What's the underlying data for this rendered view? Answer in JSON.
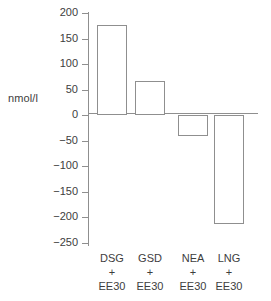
{
  "chart_data": {
    "type": "bar",
    "title": "",
    "subtitle": "",
    "xlabel": "",
    "ylabel": "nmol/l",
    "categories": [
      "DSG\n+\nEE30",
      "GSD\n+\nEE30",
      "NEA\n+\nEE30",
      "LNG\n+\nEE30"
    ],
    "category_parts": [
      {
        "drug": "DSG",
        "plus": "+",
        "estrogen": "EE30"
      },
      {
        "drug": "GSD",
        "plus": "+",
        "estrogen": "EE30"
      },
      {
        "drug": "NEA",
        "plus": "+",
        "estrogen": "EE30"
      },
      {
        "drug": "LNG",
        "plus": "+",
        "estrogen": "EE30"
      }
    ],
    "values": [
      176,
      66,
      -41,
      -213
    ],
    "ylim": [
      -250,
      200
    ],
    "yticks": [
      200,
      150,
      100,
      50,
      0,
      -50,
      -100,
      -150,
      -200,
      -250
    ],
    "ytick_labels": [
      "200",
      "150",
      "100",
      "50",
      "0",
      "−50",
      "−100",
      "−150",
      "−200",
      "−250"
    ],
    "grid": false,
    "legend": null,
    "bar_fill_color": "#ffffff",
    "bar_edge_color": "#8f8f8f",
    "axis_color": "#8f8f8f",
    "text_color": "#3d3d3d",
    "background_color": "#ffffff",
    "gap_after_index": 1
  }
}
